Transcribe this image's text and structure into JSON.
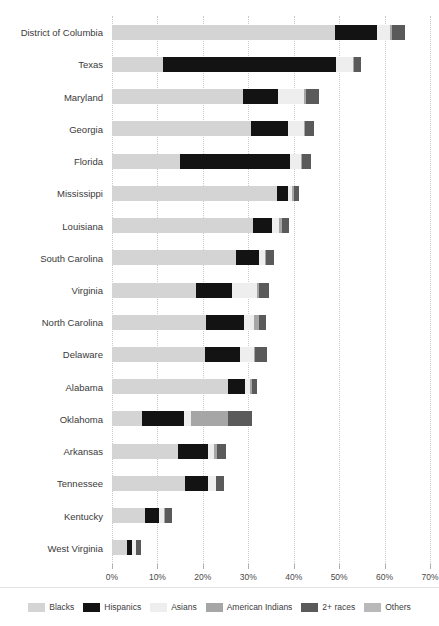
{
  "chart_data": {
    "type": "bar",
    "orientation": "horizontal",
    "stacked": true,
    "title": "",
    "subtitle": "",
    "xlabel": "",
    "ylabel": "",
    "xlim": [
      0,
      70
    ],
    "xtick_labels": [
      "0%",
      "10%",
      "20%",
      "30%",
      "40%",
      "50%",
      "60%",
      "70%"
    ],
    "xticks": [
      0,
      10,
      20,
      30,
      40,
      50,
      60,
      70
    ],
    "grid": true,
    "legend_position": "bottom",
    "categories": [
      "District of Columbia",
      "Texas",
      "Maryland",
      "Georgia",
      "Florida",
      "Mississippi",
      "Louisiana",
      "South Carolina",
      "Virginia",
      "North Carolina",
      "Delaware",
      "Alabama",
      "Oklahoma",
      "Arkansas",
      "Tennessee",
      "Kentucky",
      "West Virginia"
    ],
    "series": [
      {
        "name": "Blacks",
        "color": "#d4d4d4",
        "values": [
          49.0,
          11.3,
          28.9,
          30.5,
          15.0,
          36.4,
          31.1,
          27.2,
          18.6,
          20.7,
          20.5,
          25.6,
          6.6,
          14.6,
          16.1,
          7.3,
          3.3
        ]
      },
      {
        "name": "Hispanics",
        "color": "#131313",
        "values": [
          9.3,
          38.0,
          7.7,
          8.2,
          24.2,
          2.4,
          4.2,
          5.1,
          7.9,
          8.4,
          7.7,
          3.7,
          9.2,
          6.6,
          5.1,
          3.1,
          1.2
        ]
      },
      {
        "name": "Asians",
        "color": "#eeeeee",
        "values": [
          3.0,
          3.7,
          5.7,
          3.5,
          2.5,
          0.9,
          1.5,
          1.3,
          5.5,
          2.2,
          3.0,
          1.1,
          1.7,
          1.3,
          1.6,
          1.1,
          0.7
        ]
      },
      {
        "name": "American Indians",
        "color": "#a6a6a6",
        "values": [
          0.3,
          0.3,
          0.3,
          0.2,
          0.2,
          0.4,
          0.6,
          0.3,
          0.3,
          1.1,
          0.3,
          0.4,
          8.1,
          0.6,
          0.2,
          0.1,
          0.1
        ]
      },
      {
        "name": "2+ races",
        "color": "#5a5a5a",
        "values": [
          2.8,
          1.6,
          2.9,
          2.0,
          2.0,
          1.1,
          1.5,
          1.8,
          2.2,
          1.5,
          2.6,
          1.2,
          5.3,
          2.0,
          1.7,
          1.6,
          1.2
        ]
      },
      {
        "name": "Others",
        "color": "#b9b9b9",
        "values": [
          0.0,
          0.0,
          0.0,
          0.0,
          0.0,
          0.0,
          0.0,
          0.0,
          0.0,
          0.0,
          0.0,
          0.0,
          0.0,
          0.0,
          0.0,
          0.0,
          0.0
        ]
      }
    ]
  },
  "legend": {
    "items": [
      {
        "label": "Blacks",
        "color": "#d4d4d4"
      },
      {
        "label": "Hispanics",
        "color": "#131313"
      },
      {
        "label": "Asians",
        "color": "#eeeeee"
      },
      {
        "label": "American Indians",
        "color": "#a6a6a6"
      },
      {
        "label": "2+ races",
        "color": "#5a5a5a"
      },
      {
        "label": "Others",
        "color": "#b9b9b9"
      }
    ]
  }
}
